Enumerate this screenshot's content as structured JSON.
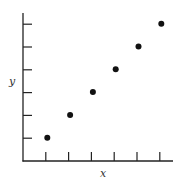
{
  "chart_data": {
    "type": "scatter",
    "title": "",
    "xlabel": "x",
    "ylabel": "y",
    "x": [
      1,
      2,
      3,
      4,
      5,
      6
    ],
    "y": [
      1,
      2,
      3,
      4,
      5,
      6
    ],
    "series": [
      {
        "name": "points",
        "x": [
          1,
          2,
          3,
          4,
          5,
          6
        ],
        "y": [
          1,
          2,
          3,
          4,
          5,
          6
        ]
      }
    ],
    "xlim": [
      0,
      6.5
    ],
    "ylim": [
      0,
      6.5
    ],
    "x_ticks": [
      1,
      2,
      3,
      4,
      5,
      6
    ],
    "y_ticks": [
      1,
      2,
      3,
      4,
      5,
      6
    ],
    "tick_labels_shown": false,
    "grid": false,
    "legend": null,
    "colors": {
      "axis": "#222222",
      "marker": "#111111",
      "label": "#333333"
    }
  },
  "labels": {
    "x": "x",
    "y": "y"
  }
}
